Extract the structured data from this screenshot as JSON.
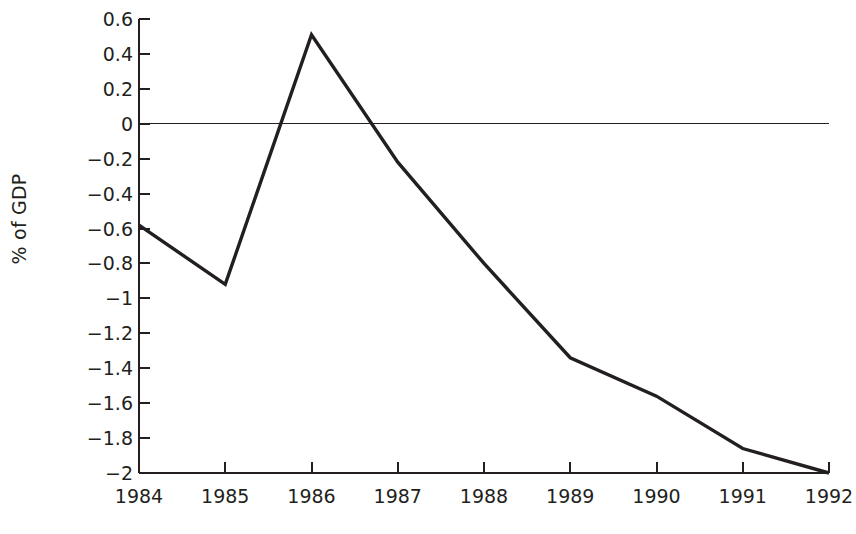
{
  "chart_data": {
    "type": "line",
    "title": "",
    "xlabel": "",
    "ylabel": "% of GDP",
    "categories": [
      "1984",
      "1985",
      "1986",
      "1987",
      "1988",
      "1989",
      "1990",
      "1991",
      "1992"
    ],
    "x": [
      1984,
      1985,
      1986,
      1987,
      1988,
      1989,
      1990,
      1991,
      1992
    ],
    "values": [
      -0.58,
      -0.92,
      0.51,
      -0.22,
      -0.8,
      -1.34,
      -1.56,
      -1.86,
      -2.0
    ],
    "series": [
      {
        "name": "",
        "values": [
          -0.58,
          -0.92,
          0.51,
          -0.22,
          -0.8,
          -1.34,
          -1.56,
          -1.86,
          -2.0
        ]
      }
    ],
    "ylim": [
      -2,
      0.6
    ],
    "xlim": [
      1984,
      1992
    ],
    "ytick_labels": [
      "0.6",
      "0.4",
      "0.2",
      "0",
      "−0.2",
      "−0.4",
      "−0.6",
      "−0.8",
      "−1",
      "−1.2",
      "−1.4",
      "−1.6",
      "−1.8",
      "−2"
    ],
    "ytick_values": [
      0.6,
      0.4,
      0.2,
      0,
      -0.2,
      -0.4,
      -0.6,
      -0.8,
      -1,
      -1.2,
      -1.4,
      -1.6,
      -1.8,
      -2
    ],
    "grid": false,
    "legend": "none",
    "zero_reference_line": 0,
    "line_color": "#231f20",
    "axis_color": "#231f20",
    "background_color": "#ffffff"
  },
  "caption": {
    "text": ""
  }
}
